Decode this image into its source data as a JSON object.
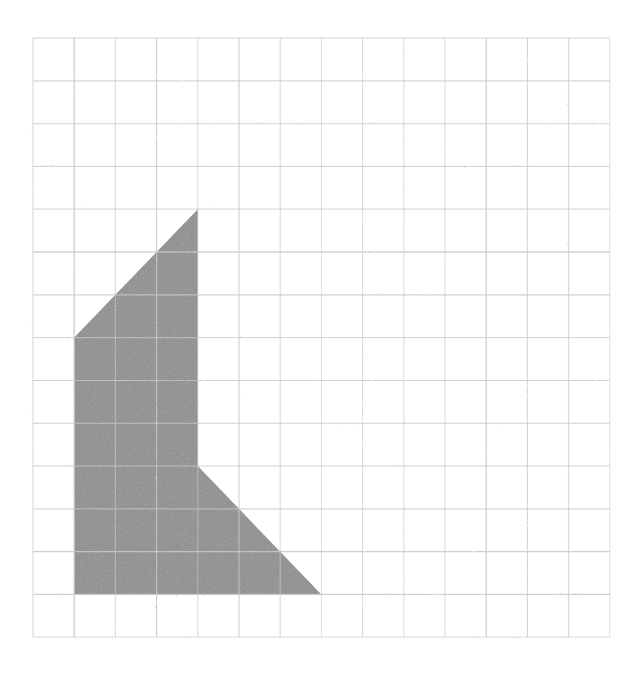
{
  "page": {
    "background_color": "#ffffff",
    "width": 638,
    "height": 674
  },
  "grid": {
    "name": "square-grid",
    "origin_x": 33,
    "origin_y": 38,
    "cell_width": 41.2,
    "cell_height": 42.8,
    "columns": 14,
    "rows": 14,
    "line_color": "#c8c8c8",
    "line_width": 1.1,
    "right_x": 610.8,
    "bottom_y": 637.2
  },
  "shape": {
    "name": "shaded-polygon",
    "fill_color": "#8d8d8d",
    "fill_opacity": 1,
    "stroke": "none",
    "description": "Shaded composite polygon: a trapezoid topped region with a triangular notch cut from the lower right",
    "vertices_grid": [
      {
        "col": 4,
        "row": 4
      },
      {
        "col": 4,
        "row": 10
      },
      {
        "col": 7,
        "row": 13
      },
      {
        "col": 1,
        "row": 13
      },
      {
        "col": 1,
        "row": 7
      }
    ],
    "vertices_pixels": [
      {
        "x": 197.8,
        "y": 209.2
      },
      {
        "x": 197.8,
        "y": 466.0
      },
      {
        "x": 321.4,
        "y": 594.4
      },
      {
        "x": 74.2,
        "y": 594.4
      },
      {
        "x": 74.2,
        "y": 337.6
      }
    ],
    "edges": [
      {
        "name": "right-vertical-edge",
        "from": 0,
        "to": 1,
        "type": "vertical"
      },
      {
        "name": "lower-right-diagonal-edge",
        "from": 1,
        "to": 2,
        "type": "diagonal"
      },
      {
        "name": "bottom-edge",
        "from": 2,
        "to": 3,
        "type": "horizontal"
      },
      {
        "name": "left-vertical-edge",
        "from": 3,
        "to": 4,
        "type": "vertical"
      },
      {
        "name": "upper-left-diagonal-edge",
        "from": 4,
        "to": 0,
        "type": "diagonal"
      }
    ]
  },
  "chart_data": {
    "type": "scatter",
    "xlabel": "",
    "ylabel": "",
    "xlim": [
      0,
      14
    ],
    "ylim": [
      0,
      14
    ],
    "grid": true,
    "legend": "none",
    "series": [
      {
        "name": "shaded-polygon-vertices",
        "x": [
          4,
          4,
          7,
          1,
          1
        ],
        "y": [
          10,
          4,
          1,
          1,
          7
        ]
      }
    ],
    "annotations": []
  }
}
